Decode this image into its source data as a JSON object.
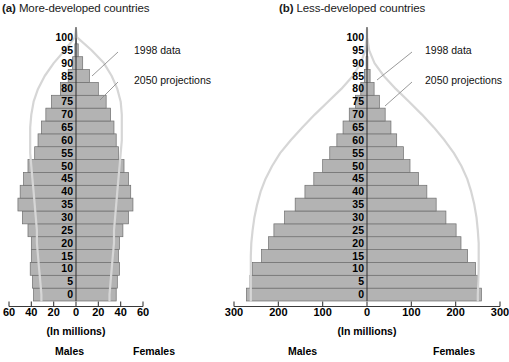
{
  "figure": {
    "axis_caption": "(In millions)",
    "males_label": "Males",
    "females_label": "Females",
    "annotations": {
      "data_1998": "1998 data",
      "projections_2050": "2050 projections"
    },
    "colors": {
      "bar_fill": "#b3b3b3",
      "bar_stroke": "#6e6e6e",
      "curve": "#d6d6d6",
      "axis": "#555555",
      "text": "#1a1a1a",
      "background": "#ffffff"
    }
  },
  "panels": [
    {
      "id": "a",
      "tag": "(a)",
      "title": "More-developed countries",
      "axis_caption": "(In millions)",
      "males_label": "Males",
      "females_label": "Females",
      "annotations": {
        "data_1998": "1998 data",
        "projections_2050": "2050 projections"
      },
      "tick_labels": [
        "60",
        "40",
        "20",
        "0",
        "20",
        "40",
        "60"
      ]
    },
    {
      "id": "b",
      "tag": "(b)",
      "title": "Less-developed countries",
      "axis_caption": "(In millions)",
      "males_label": "Males",
      "females_label": "Females",
      "annotations": {
        "data_1998": "1998 data",
        "projections_2050": "2050 projections"
      },
      "tick_labels": [
        "300",
        "200",
        "100",
        "0",
        "100",
        "200",
        "300"
      ]
    }
  ],
  "chart_data": [
    {
      "type": "bar",
      "subtype": "population-pyramid",
      "panel": "a",
      "title": "(a) More-developed countries",
      "xlabel": "(In millions)",
      "ylabel": "Age",
      "xlim": [
        -60,
        60
      ],
      "xticks": [
        -60,
        -40,
        -20,
        0,
        20,
        40,
        60
      ],
      "xtick_labels": [
        "60",
        "40",
        "20",
        "0",
        "20",
        "40",
        "60"
      ],
      "grid": false,
      "legend": [
        "1998 data",
        "2050 projections"
      ],
      "legend_position": "annotated-callouts",
      "categories": [
        "0",
        "5",
        "10",
        "15",
        "20",
        "25",
        "30",
        "35",
        "40",
        "45",
        "50",
        "55",
        "60",
        "65",
        "70",
        "75",
        "80",
        "85",
        "90",
        "95",
        "100"
      ],
      "series": [
        {
          "name": "Males (1998 data)",
          "side": "left",
          "values": [
            38,
            39,
            41,
            40,
            40,
            43,
            48,
            52,
            50,
            47,
            43,
            37,
            34,
            31,
            27,
            22,
            14,
            7,
            3,
            1,
            0.2
          ]
        },
        {
          "name": "Females (1998 data)",
          "side": "right",
          "values": [
            36,
            37,
            39,
            38,
            39,
            42,
            47,
            51,
            49,
            47,
            43,
            38,
            36,
            34,
            31,
            27,
            20,
            12,
            6,
            2,
            0.4
          ]
        }
      ],
      "overlays": [
        {
          "name": "2050 projections",
          "style": "outline-curve",
          "side": "left",
          "values": [
            31,
            32,
            33,
            34,
            35,
            35,
            36,
            37,
            38,
            39,
            40,
            41,
            41,
            41,
            40,
            38,
            34,
            28,
            20,
            10,
            1
          ]
        },
        {
          "name": "2050 projections",
          "style": "outline-curve",
          "side": "right",
          "values": [
            30,
            31,
            32,
            33,
            34,
            34,
            35,
            36,
            37,
            38,
            39,
            40,
            41,
            41,
            41,
            40,
            37,
            32,
            25,
            14,
            1
          ]
        }
      ]
    },
    {
      "type": "bar",
      "subtype": "population-pyramid",
      "panel": "b",
      "title": "(b) Less-developed countries",
      "xlabel": "(In millions)",
      "ylabel": "Age",
      "xlim": [
        -300,
        300
      ],
      "xticks": [
        -300,
        -200,
        -100,
        0,
        100,
        200,
        300
      ],
      "xtick_labels": [
        "300",
        "200",
        "100",
        "0",
        "100",
        "200",
        "300"
      ],
      "grid": false,
      "legend": [
        "1998 data",
        "2050 projections"
      ],
      "legend_position": "annotated-callouts",
      "categories": [
        "0",
        "5",
        "10",
        "15",
        "20",
        "25",
        "30",
        "35",
        "40",
        "45",
        "50",
        "55",
        "60",
        "65",
        "70",
        "75",
        "80",
        "85",
        "90",
        "95",
        "100"
      ],
      "series": [
        {
          "name": "Males (1998 data)",
          "side": "left",
          "values": [
            272,
            264,
            258,
            238,
            222,
            210,
            186,
            162,
            140,
            120,
            100,
            84,
            68,
            54,
            40,
            26,
            14,
            6,
            2,
            0.5,
            0.1
          ]
        },
        {
          "name": "Females (1998 data)",
          "side": "right",
          "values": [
            258,
            250,
            245,
            227,
            212,
            201,
            178,
            156,
            135,
            116,
            97,
            82,
            67,
            54,
            41,
            28,
            16,
            7,
            2,
            0.6,
            0.1
          ]
        }
      ],
      "overlays": [
        {
          "name": "2050 projections",
          "style": "outline-curve",
          "side": "left",
          "values": [
            262,
            262,
            262,
            262,
            261,
            258,
            254,
            248,
            240,
            229,
            214,
            196,
            172,
            146,
            118,
            88,
            58,
            32,
            14,
            4,
            0.5
          ]
        },
        {
          "name": "2050 projections",
          "style": "outline-curve",
          "side": "right",
          "values": [
            250,
            251,
            252,
            252,
            252,
            250,
            247,
            242,
            235,
            226,
            213,
            196,
            175,
            151,
            124,
            95,
            65,
            38,
            17,
            5,
            0.5
          ]
        }
      ]
    }
  ]
}
